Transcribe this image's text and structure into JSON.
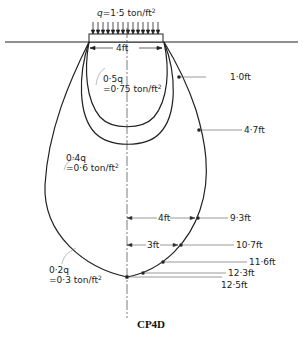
{
  "load": {
    "label_prefix": "q=1·5 ton/ft",
    "label_sup": "2",
    "footing_width": "4ft"
  },
  "contours": [
    {
      "name": "0.5q",
      "ratio": "0·5q",
      "value": "=0·75 ton/ft",
      "sup": "2"
    },
    {
      "name": "0.4q",
      "ratio": "0·4q",
      "value": "=0·6 ton/ft",
      "sup": "2"
    },
    {
      "name": "0.2q",
      "ratio": "0·2q",
      "value": "=0·3 ton/ft",
      "sup": "2"
    }
  ],
  "depth_markers": [
    {
      "label": "1·0ft"
    },
    {
      "label": "4·7ft"
    },
    {
      "label": "9·3ft",
      "offset": "4ft"
    },
    {
      "label": "10·7ft",
      "offset": "3ft"
    },
    {
      "label": "11·6ft"
    },
    {
      "label": "12·3ft"
    },
    {
      "label": "12·5ft"
    }
  ],
  "caption": "CP4D"
}
